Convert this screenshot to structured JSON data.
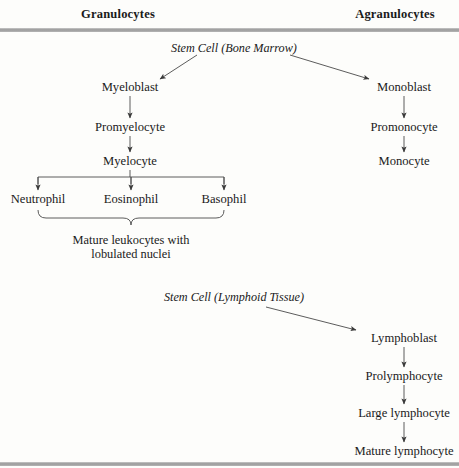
{
  "figure": {
    "background_color": "#fdfdfb",
    "ink_color": "#1a1a1a",
    "rule_color": "#9a9a9a",
    "headers": {
      "left": "Granulocytes",
      "right": "Agranulocytes"
    },
    "stem_cells": {
      "bone_marrow": "Stem Cell (Bone Marrow)",
      "lymphoid": "Stem Cell (Lymphoid Tissue)"
    },
    "granulocyte_line": {
      "myeloblast": "Myeloblast",
      "promyelocyte": "Promyelocyte",
      "myelocyte": "Myelocyte",
      "neutrophil": "Neutrophil",
      "eosinophil": "Eosinophil",
      "basophil": "Basophil"
    },
    "brace_caption": {
      "line1": "Mature leukocytes with",
      "line2": "lobulated nuclei"
    },
    "monocyte_line": {
      "monoblast": "Monoblast",
      "promonocyte": "Promonocyte",
      "monocyte": "Monocyte"
    },
    "lymphocyte_line": {
      "lymphoblast": "Lymphoblast",
      "prolymphocyte": "Prolymphocyte",
      "large_lymphocyte": "Large lymphocyte",
      "mature_lymphocyte": "Mature lymphocyte"
    }
  }
}
